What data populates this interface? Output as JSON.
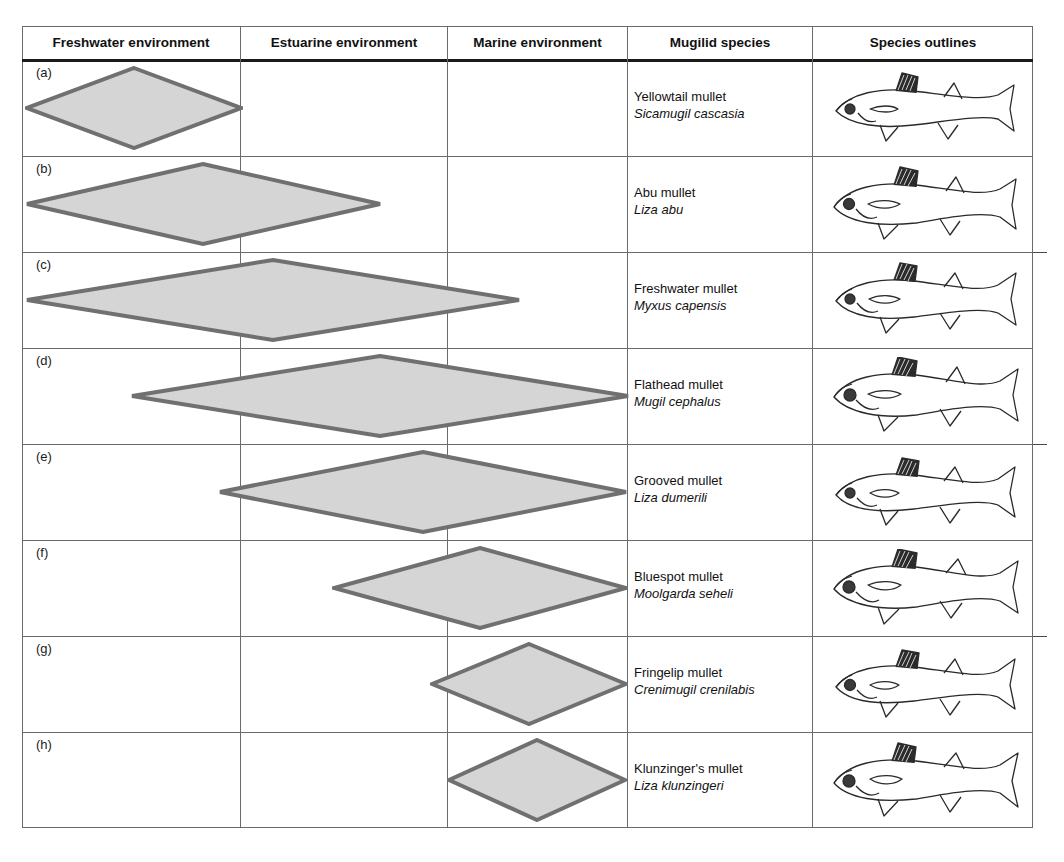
{
  "figure": {
    "columns": [
      {
        "label": "Freshwater environment",
        "key": "freshwater"
      },
      {
        "label": "Estuarine environment",
        "key": "estuarine"
      },
      {
        "label": "Marine environment",
        "key": "marine"
      },
      {
        "label": "Mugilid species",
        "key": "species"
      },
      {
        "label": "Species outlines",
        "key": "outlines"
      }
    ],
    "colors": {
      "diamond_fill": "#d5d5d5",
      "diamond_stroke": "#707070",
      "grid_line": "#6a6a6a",
      "header_rule": "#1a1a1a",
      "text": "#111111"
    },
    "rows": [
      {
        "tag": "(a)",
        "common_name": "Yellowtail mullet",
        "scientific_name": "Sicamugil cascasia",
        "diamond": {
          "left": 3,
          "width": 218
        },
        "environments": [
          "freshwater"
        ]
      },
      {
        "tag": "(b)",
        "common_name": "Abu mullet",
        "scientific_name": "Liza abu",
        "diamond": {
          "left": 3,
          "width": 357
        },
        "environments": [
          "freshwater",
          "estuarine"
        ]
      },
      {
        "tag": "(c)",
        "common_name": "Freshwater mullet",
        "scientific_name": "Myxus capensis",
        "diamond": {
          "left": 3,
          "width": 496
        },
        "environments": [
          "freshwater",
          "estuarine",
          "marine"
        ]
      },
      {
        "tag": "(d)",
        "common_name": "Flathead mullet",
        "scientific_name": "Mugil cephalus",
        "diamond": {
          "left": 108,
          "width": 500
        },
        "environments": [
          "freshwater",
          "estuarine",
          "marine"
        ]
      },
      {
        "tag": "(e)",
        "common_name": "Grooved mullet",
        "scientific_name": "Liza dumerili",
        "diamond": {
          "left": 196,
          "width": 410
        },
        "environments": [
          "estuarine",
          "marine"
        ]
      },
      {
        "tag": "(f)",
        "common_name": "Bluespot mullet",
        "scientific_name": "Moolgarda seheli",
        "diamond": {
          "left": 310,
          "width": 296
        },
        "environments": [
          "estuarine",
          "marine"
        ]
      },
      {
        "tag": "(g)",
        "common_name": "Fringelip mullet",
        "scientific_name": "Crenimugil crenilabis",
        "diamond": {
          "left": 408,
          "width": 198
        },
        "environments": [
          "marine"
        ]
      },
      {
        "tag": "(h)",
        "common_name": "Klunzinger's mullet",
        "scientific_name": "Liza klunzingeri",
        "diamond": {
          "left": 425,
          "width": 180
        },
        "environments": [
          "marine"
        ]
      }
    ]
  }
}
